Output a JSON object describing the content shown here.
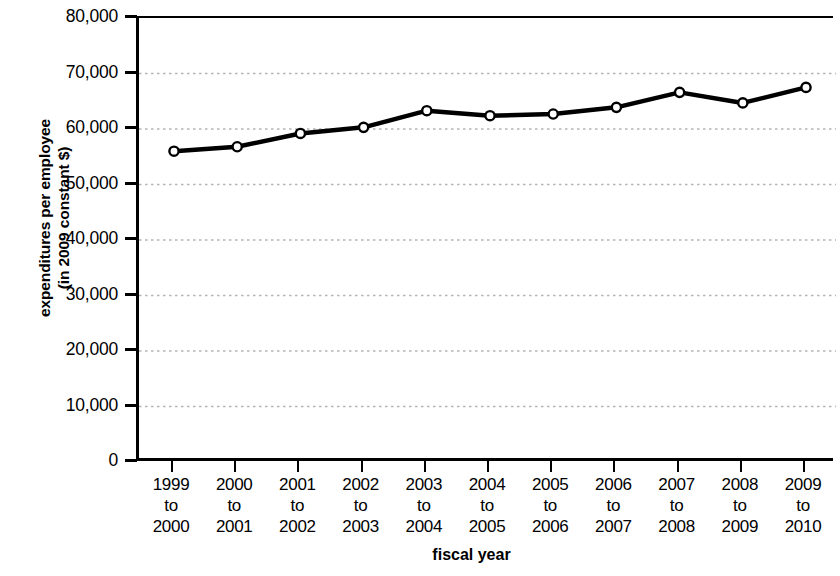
{
  "chart_data": {
    "type": "line",
    "title": "",
    "xlabel": "fiscal year",
    "ylabel": "expenditures per employee (in 2009 constant $)",
    "ylabel_line1": "expenditures per employee",
    "ylabel_line2": "(in 2009 constant $)",
    "categories": [
      "1999 to 2000",
      "2000 to 2001",
      "2001 to 2002",
      "2002 to 2003",
      "2003 to 2004",
      "2004 to 2005",
      "2005 to 2006",
      "2006 to 2007",
      "2007 to 2008",
      "2008 to 2009",
      "2009 to 2010"
    ],
    "category_lines": [
      [
        "1999",
        "to",
        "2000"
      ],
      [
        "2000",
        "to",
        "2001"
      ],
      [
        "2001",
        "to",
        "2002"
      ],
      [
        "2002",
        "to",
        "2003"
      ],
      [
        "2003",
        "to",
        "2004"
      ],
      [
        "2004",
        "to",
        "2005"
      ],
      [
        "2005",
        "to",
        "2006"
      ],
      [
        "2006",
        "to",
        "2007"
      ],
      [
        "2007",
        "to",
        "2008"
      ],
      [
        "2008",
        "to",
        "2009"
      ],
      [
        "2009",
        "to",
        "2010"
      ]
    ],
    "values": [
      56000,
      56800,
      59200,
      60300,
      63300,
      62400,
      62700,
      63900,
      66600,
      64700,
      67500
    ],
    "ylim": [
      0,
      80000
    ],
    "ytick_values": [
      0,
      10000,
      20000,
      30000,
      40000,
      50000,
      60000,
      70000,
      80000
    ],
    "ytick_labels": [
      "0",
      "10,000",
      "20,000",
      "30,000",
      "40,000",
      "50,000",
      "60,000",
      "70,000",
      "80,000"
    ],
    "grid": true,
    "grid_style": "dotted",
    "grid_axis": "y",
    "legend": "none",
    "line_color": "#000000",
    "marker": "open-circle",
    "marker_face_color": "#ffffff",
    "grid_color": "#b4b4b4"
  }
}
